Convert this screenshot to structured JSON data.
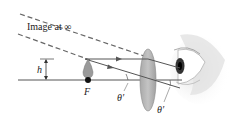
{
  "diagram": {
    "labels": {
      "image_at_infinity": "Image at ∞",
      "height": "h",
      "focal_point": "F",
      "angle_1": "θ′",
      "angle_2": "θ′"
    },
    "colors": {
      "line": "#555555",
      "dashed": "#666666",
      "lens_fill": "#b8b8b8",
      "object_fill": "#9a9a9a",
      "focal_dot": "#111111",
      "background": "#ffffff"
    },
    "elements": [
      "optical-axis",
      "object",
      "focal-point",
      "converging-lens",
      "parallel-ray",
      "central-ray",
      "virtual-image-rays",
      "eye"
    ]
  }
}
